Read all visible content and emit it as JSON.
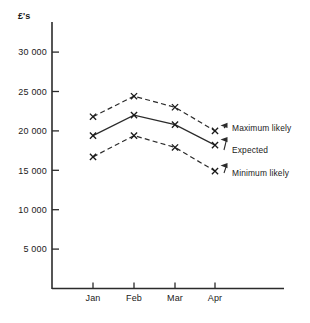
{
  "chart_data": {
    "type": "line",
    "title": "",
    "subtitle": "",
    "unit_label": "£'s",
    "xlabel": "",
    "ylabel": "",
    "categories": [
      "Jan",
      "Feb",
      "Mar",
      "Apr"
    ],
    "ylim": [
      0,
      32000
    ],
    "yticks": [
      5000,
      10000,
      15000,
      20000,
      25000,
      30000
    ],
    "ytick_labels": [
      "5 000",
      "10 000",
      "15 000",
      "20 000",
      "25 000",
      "30 000"
    ],
    "grid": false,
    "legend_position": "inline-annotations",
    "series": [
      {
        "name": "Maximum likely",
        "style": "dashed",
        "marker": "x",
        "values": [
          21800,
          24400,
          23000,
          20000
        ]
      },
      {
        "name": "Expected",
        "style": "solid",
        "marker": "x",
        "values": [
          19400,
          22000,
          20800,
          18200
        ]
      },
      {
        "name": "Minimum likely",
        "style": "dashed",
        "marker": "x",
        "values": [
          16700,
          19400,
          17900,
          14900
        ]
      }
    ],
    "annotations": [
      {
        "label": "Maximum likely",
        "points_to_series": "Maximum likely",
        "points_to_category": "Apr"
      },
      {
        "label": "Expected",
        "points_to_series": "Expected",
        "points_to_category": "Apr"
      },
      {
        "label": "Minimum likely",
        "points_to_series": "Minimum likely",
        "points_to_category": "Apr"
      }
    ]
  },
  "colors": {
    "ink": "#2b2b2b",
    "background": "#ffffff"
  }
}
